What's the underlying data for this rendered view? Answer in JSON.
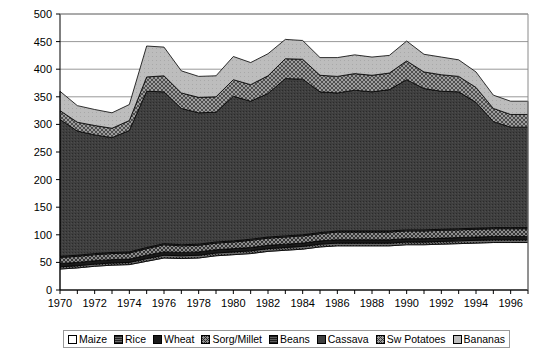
{
  "chart_data": {
    "type": "area",
    "stacked": true,
    "title": "",
    "xlabel": "",
    "ylabel": "",
    "xlim": [
      1970,
      1997
    ],
    "ylim": [
      0,
      500
    ],
    "ytick_step": 50,
    "grid": true,
    "legend_position": "bottom",
    "x": [
      1970,
      1971,
      1972,
      1973,
      1974,
      1975,
      1976,
      1977,
      1978,
      1979,
      1980,
      1981,
      1982,
      1983,
      1984,
      1985,
      1986,
      1987,
      1988,
      1989,
      1990,
      1991,
      1992,
      1993,
      1994,
      1995,
      1996,
      1997
    ],
    "xticks": [
      "1970",
      "1972",
      "1974",
      "1976",
      "1978",
      "1980",
      "1982",
      "1984",
      "1986",
      "1988",
      "1990",
      "1992",
      "1994",
      "1996"
    ],
    "yticks": [
      "0",
      "50",
      "100",
      "150",
      "200",
      "250",
      "300",
      "350",
      "400",
      "450",
      "500"
    ],
    "series": [
      {
        "name": "Maize",
        "pattern": "solid-white",
        "color": "#ffffff",
        "values": [
          38,
          40,
          43,
          45,
          46,
          52,
          58,
          57,
          58,
          62,
          64,
          66,
          70,
          72,
          74,
          78,
          80,
          80,
          80,
          80,
          82,
          82,
          83,
          84,
          85,
          86,
          86,
          86
        ]
      },
      {
        "name": "Rice",
        "pattern": "dark-dotted",
        "color": "#585858",
        "values": [
          4,
          4,
          4,
          4,
          4,
          5,
          5,
          5,
          5,
          5,
          5,
          5,
          5,
          5,
          5,
          5,
          5,
          5,
          5,
          5,
          5,
          5,
          5,
          5,
          5,
          5,
          5,
          5
        ]
      },
      {
        "name": "Wheat",
        "pattern": "solid-black",
        "color": "#1a1a1a",
        "values": [
          6,
          6,
          6,
          6,
          6,
          6,
          6,
          6,
          6,
          6,
          6,
          6,
          6,
          6,
          6,
          6,
          6,
          6,
          6,
          6,
          6,
          6,
          6,
          6,
          6,
          6,
          6,
          6
        ]
      },
      {
        "name": "Sorg/Millet",
        "pattern": "crosshatch-mid",
        "color": "#6e6e6e",
        "values": [
          11,
          11,
          11,
          11,
          11,
          12,
          13,
          12,
          12,
          12,
          12,
          13,
          13,
          13,
          13,
          13,
          14,
          14,
          14,
          14,
          14,
          14,
          14,
          14,
          14,
          14,
          14,
          14
        ]
      },
      {
        "name": "Beans",
        "pattern": "dot-grid",
        "color": "#4a4a4a",
        "values": [
          2,
          2,
          2,
          2,
          2,
          2,
          2,
          2,
          2,
          2,
          2,
          2,
          2,
          2,
          2,
          2,
          2,
          2,
          2,
          2,
          2,
          2,
          2,
          2,
          2,
          2,
          2,
          2
        ]
      },
      {
        "name": "Cassava",
        "pattern": "dense-dark",
        "color": "#3b3b3b",
        "values": [
          248,
          225,
          215,
          208,
          220,
          283,
          275,
          247,
          238,
          235,
          262,
          250,
          260,
          285,
          282,
          255,
          250,
          255,
          252,
          256,
          272,
          256,
          250,
          248,
          228,
          192,
          182,
          182
        ]
      },
      {
        "name": "Sw Potatoes",
        "pattern": "crosshatch-light",
        "color": "#8a8a8a",
        "values": [
          16,
          16,
          17,
          17,
          18,
          26,
          29,
          28,
          28,
          28,
          30,
          30,
          32,
          36,
          36,
          30,
          30,
          30,
          30,
          30,
          34,
          30,
          30,
          28,
          27,
          24,
          23,
          23
        ]
      },
      {
        "name": "Bananas",
        "pattern": "light-gray",
        "color": "#b8b8b8",
        "values": [
          35,
          30,
          29,
          28,
          29,
          56,
          52,
          40,
          38,
          38,
          42,
          40,
          40,
          35,
          34,
          32,
          34,
          34,
          33,
          32,
          36,
          32,
          32,
          30,
          28,
          24,
          24,
          24
        ]
      }
    ]
  },
  "legend": {
    "items": [
      {
        "label": "Maize"
      },
      {
        "label": "Rice"
      },
      {
        "label": "Wheat"
      },
      {
        "label": "Sorg/Millet"
      },
      {
        "label": "Beans"
      },
      {
        "label": "Cassava"
      },
      {
        "label": "Sw Potatoes"
      },
      {
        "label": "Bananas"
      }
    ]
  }
}
